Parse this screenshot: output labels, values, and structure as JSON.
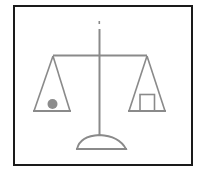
{
  "diagram": {
    "left_pan": {
      "object": "circle",
      "label": "ball"
    },
    "right_pan": {
      "object": "square",
      "label": "block"
    },
    "state": "level"
  },
  "colors": {
    "frame": "#1a1a1a",
    "structure": "#8a8a8a",
    "ball": "#8c8c8c",
    "background": "#ffffff"
  }
}
